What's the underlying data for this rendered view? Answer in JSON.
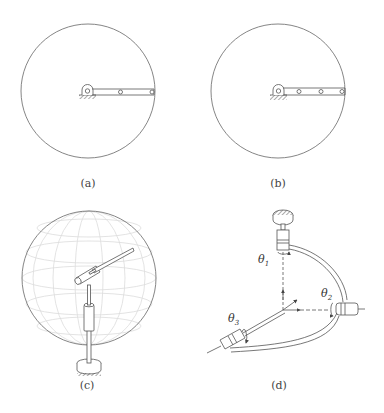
{
  "figure": {
    "panels": [
      {
        "id": "a",
        "caption": "(a)",
        "description": "planar two-link arm in circular workspace",
        "joint_count": 2
      },
      {
        "id": "b",
        "caption": "(b)",
        "description": "planar three-link arm in circular workspace",
        "joint_count": 3
      },
      {
        "id": "c",
        "caption": "(c)",
        "description": "spatial arm inside spherical workspace"
      },
      {
        "id": "d",
        "caption": "(d)",
        "description": "spherical mechanism with three revolute joints",
        "labels": {
          "theta1": "θ",
          "theta1_sub": "1",
          "theta2": "θ",
          "theta2_sub": "2",
          "theta3": "θ",
          "theta3_sub": "3"
        }
      }
    ],
    "colors": {
      "line": "#555555",
      "grid": "#d8d8d8",
      "background": "#ffffff"
    }
  }
}
